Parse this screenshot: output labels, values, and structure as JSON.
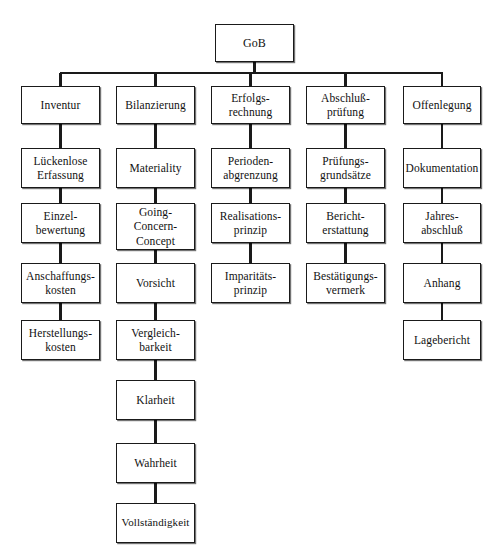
{
  "diagram": {
    "title": "GoB",
    "root": {
      "id": "gob",
      "label": "GoB",
      "x": 215,
      "y": 24,
      "w": 79,
      "h": 38
    },
    "bus": {
      "y": 73,
      "x1": 60,
      "x2": 443
    },
    "columns": [
      {
        "name": "Inventur",
        "center": 60.5,
        "nodes": [
          {
            "id": "inventur",
            "label": "Inventur",
            "x": 21,
            "y": 86,
            "w": 79,
            "h": 38
          },
          {
            "id": "lueckenlose-erfassung",
            "label": "Lückenlose\nErfassung",
            "x": 21,
            "y": 148,
            "w": 79,
            "h": 40
          },
          {
            "id": "einzelbewertung",
            "label": "Einzel-\nbewertung",
            "x": 21,
            "y": 203,
            "w": 79,
            "h": 40
          },
          {
            "id": "anschaffungskosten",
            "label": "Anschaffungs-\nkosten",
            "x": 21,
            "y": 263,
            "w": 79,
            "h": 40
          },
          {
            "id": "herstellungskosten",
            "label": "Herstellungs-\nkosten",
            "x": 21,
            "y": 320,
            "w": 79,
            "h": 40
          }
        ]
      },
      {
        "name": "Bilanzierung",
        "center": 155.5,
        "nodes": [
          {
            "id": "bilanzierung",
            "label": "Bilanzierung",
            "x": 116,
            "y": 86,
            "w": 79,
            "h": 38
          },
          {
            "id": "materiality",
            "label": "Materiality",
            "x": 116,
            "y": 148,
            "w": 79,
            "h": 40
          },
          {
            "id": "going-concern-concept",
            "label": "Going-\nConcern-\nConcept",
            "x": 116,
            "y": 203,
            "w": 79,
            "h": 47
          },
          {
            "id": "vorsicht",
            "label": "Vorsicht",
            "x": 116,
            "y": 263,
            "w": 79,
            "h": 40
          },
          {
            "id": "vergleichbarkeit",
            "label": "Vergleich-\nbarkeit",
            "x": 116,
            "y": 320,
            "w": 79,
            "h": 40
          },
          {
            "id": "klarheit",
            "label": "Klarheit",
            "x": 116,
            "y": 380,
            "w": 79,
            "h": 40
          },
          {
            "id": "wahrheit",
            "label": "Wahrheit",
            "x": 116,
            "y": 443,
            "w": 79,
            "h": 40
          },
          {
            "id": "vollstaendigkeit",
            "label": "Vollständigkeit",
            "x": 116,
            "y": 503,
            "w": 79,
            "h": 40
          }
        ]
      },
      {
        "name": "Erfolgsrechnung",
        "center": 250.5,
        "nodes": [
          {
            "id": "erfolgsrechnung",
            "label": "Erfolgs-\nrechnung",
            "x": 211,
            "y": 86,
            "w": 79,
            "h": 38
          },
          {
            "id": "periodenabgrenzung",
            "label": "Perioden-\nabgrenzung",
            "x": 211,
            "y": 148,
            "w": 79,
            "h": 40
          },
          {
            "id": "realisationsprinzip",
            "label": "Realisations-\nprinzip",
            "x": 211,
            "y": 203,
            "w": 79,
            "h": 40
          },
          {
            "id": "imparitaetsprinzip",
            "label": "Imparitäts-\nprinzip",
            "x": 211,
            "y": 263,
            "w": 79,
            "h": 40
          }
        ]
      },
      {
        "name": "Abschlußprüfung",
        "center": 345.5,
        "nodes": [
          {
            "id": "abschlusspruefung",
            "label": "Abschluß-\nprüfung",
            "x": 306,
            "y": 86,
            "w": 79,
            "h": 38
          },
          {
            "id": "pruefungsgrundsaetze",
            "label": "Prüfungs-\ngrundsätze",
            "x": 306,
            "y": 148,
            "w": 79,
            "h": 40
          },
          {
            "id": "berichterstattung",
            "label": "Bericht-\nerstattung",
            "x": 306,
            "y": 203,
            "w": 79,
            "h": 40
          },
          {
            "id": "bestaetigungsvermerk",
            "label": "Bestätigungs-\nvermerk",
            "x": 306,
            "y": 263,
            "w": 79,
            "h": 40
          }
        ]
      },
      {
        "name": "Offenlegung",
        "center": 442,
        "nodes": [
          {
            "id": "offenlegung",
            "label": "Offenlegung",
            "x": 403,
            "y": 86,
            "w": 78,
            "h": 38
          },
          {
            "id": "dokumentation",
            "label": "Dokumentation",
            "x": 403,
            "y": 148,
            "w": 78,
            "h": 40
          },
          {
            "id": "jahresabschluss",
            "label": "Jahres-\nabschluß",
            "x": 403,
            "y": 203,
            "w": 78,
            "h": 40
          },
          {
            "id": "anhang",
            "label": "Anhang",
            "x": 403,
            "y": 263,
            "w": 78,
            "h": 40
          },
          {
            "id": "lagebericht",
            "label": "Lagebericht",
            "x": 403,
            "y": 320,
            "w": 78,
            "h": 40
          }
        ]
      }
    ],
    "colors": {
      "stroke": "#1a1a1a",
      "fill": "#ffffff",
      "text": "#111111"
    }
  }
}
